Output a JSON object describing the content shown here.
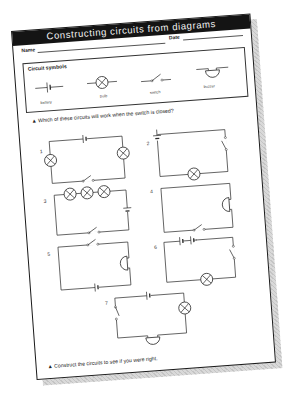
{
  "worksheet": {
    "title": "Constructing circuits from diagrams",
    "fields": {
      "name_label": "Name",
      "date_label": "Date"
    },
    "symbols": {
      "heading": "Circuit symbols",
      "items": [
        {
          "label": "battery",
          "icon": "battery-icon"
        },
        {
          "label": "bulb",
          "icon": "bulb-icon"
        },
        {
          "label": "switch",
          "icon": "switch-icon"
        },
        {
          "label": "buzzer",
          "icon": "buzzer-icon"
        }
      ]
    },
    "question": "▲ Which of these circuits will work when the switch is closed?",
    "circuits": [
      {
        "number": "1",
        "components": [
          "battery",
          "bulb",
          "bulb",
          "switch"
        ]
      },
      {
        "number": "2",
        "components": [
          "battery",
          "switch",
          "bulb"
        ]
      },
      {
        "number": "3",
        "components": [
          "bulb",
          "bulb",
          "bulb",
          "battery",
          "switch"
        ]
      },
      {
        "number": "4",
        "components": [
          "buzzer",
          "switch"
        ]
      },
      {
        "number": "5",
        "components": [
          "switch",
          "buzzer",
          "battery"
        ]
      },
      {
        "number": "6",
        "components": [
          "battery",
          "battery",
          "switch",
          "bulb"
        ]
      },
      {
        "number": "7",
        "components": [
          "battery",
          "switch",
          "bulb",
          "buzzer"
        ]
      }
    ],
    "footer_instruction": "▲ Construct the circuits to see if you were right."
  },
  "colors": {
    "title_bar": "#141414",
    "title_text": "#f4f4f4",
    "ink": "#2a2a2a",
    "paper": "#ffffff",
    "shadow": "#d0d0d0"
  }
}
